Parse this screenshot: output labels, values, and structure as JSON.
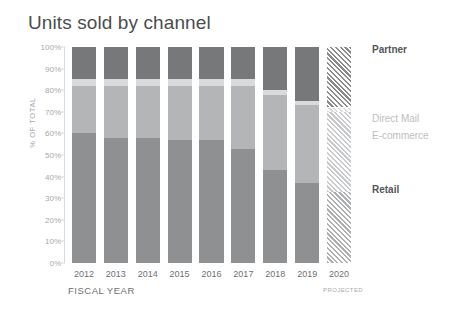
{
  "chart_data": {
    "type": "bar",
    "subtype": "stacked-percentage-column",
    "title": "Units sold by channel",
    "xlabel": "FISCAL YEAR",
    "ylabel": "% OF TOTAL",
    "ylim": [
      0,
      100
    ],
    "grid": false,
    "legend_position": "right",
    "categories": [
      "2012",
      "2013",
      "2014",
      "2015",
      "2016",
      "2017",
      "2018",
      "2019",
      "2020"
    ],
    "category_notes": {
      "2020": "PROJECTED"
    },
    "projected_categories": [
      "2020"
    ],
    "y_ticks": [
      "0%",
      "10%",
      "20%",
      "30%",
      "40%",
      "50%",
      "60%",
      "70%",
      "80%",
      "90%",
      "100%"
    ],
    "series": [
      {
        "name": "Retail",
        "color": "#8f9092",
        "values": [
          60,
          58,
          58,
          57,
          57,
          53,
          43,
          37,
          33
        ]
      },
      {
        "name": "E-commerce",
        "color": "#b4b5b7",
        "values": [
          22,
          24,
          24,
          25,
          25,
          29,
          35,
          36,
          37
        ]
      },
      {
        "name": "Direct Mail",
        "color": "#d9dadb",
        "values": [
          3,
          3,
          3,
          3,
          3,
          3,
          2,
          2,
          2
        ]
      },
      {
        "name": "Partner",
        "color": "#77787a",
        "values": [
          15,
          15,
          15,
          15,
          15,
          15,
          20,
          25,
          28
        ]
      }
    ],
    "legend_entries": [
      {
        "label": "Partner",
        "emphasis": "strong"
      },
      {
        "label": "Direct Mail",
        "emphasis": "muted"
      },
      {
        "label": "E-commerce",
        "emphasis": "muted"
      },
      {
        "label": "Retail",
        "emphasis": "strong"
      }
    ]
  }
}
